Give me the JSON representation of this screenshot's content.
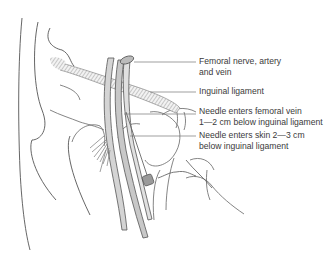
{
  "diagram": {
    "labels": [
      {
        "id": "femoral-nerve-artery-vein",
        "line1": "Femoral nerve, artery",
        "line2": "and vein"
      },
      {
        "id": "inguinal-ligament",
        "line1": "Inguinal ligament",
        "line2": ""
      },
      {
        "id": "needle-enters-femoral-vein",
        "line1": "Needle enters femoral vein",
        "line2": "1—2 cm below inguinal ligament"
      },
      {
        "id": "needle-enters-skin",
        "line1": "Needle enters skin 2—3 cm",
        "line2": "below inguinal ligament"
      }
    ],
    "colors": {
      "outline": "#555555",
      "vessel_fill": "#cfcfcf",
      "ligament_hatch": "#9a9a9a",
      "label_text": "#3a3a3a"
    }
  }
}
